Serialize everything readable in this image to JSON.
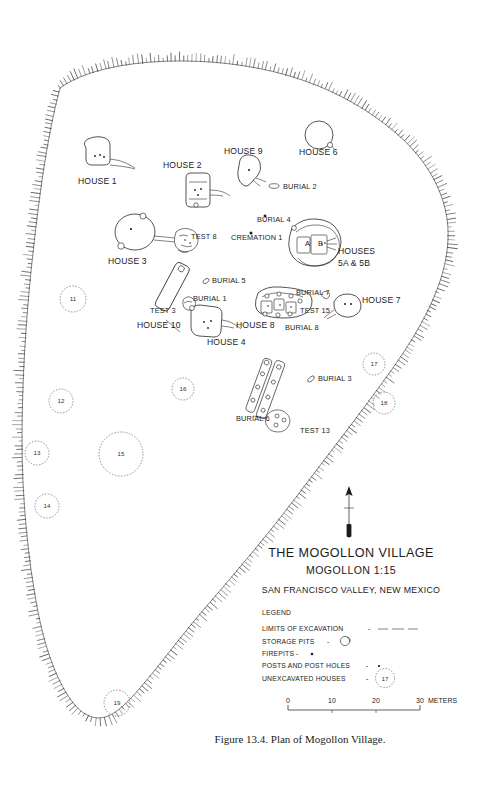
{
  "figure": {
    "caption": "Figure 13.4.  Plan of Mogollon Village.",
    "title": "THE MOGOLLON VILLAGE",
    "subtitle": "MOGOLLON   1:15",
    "location": "SAN FRANCISCO VALLEY, NEW MEXICO",
    "north_arrow": "north-arrow"
  },
  "legend": {
    "heading": "LEGEND",
    "items": [
      {
        "label": "LIMITS OF EXCAVATION",
        "separator": "-",
        "symbol": "dashed-line"
      },
      {
        "label": "STORAGE PITS",
        "separator": "-",
        "symbol": "storage-pit-oval"
      },
      {
        "label": "FIREPITS",
        "separator": "-",
        "symbol": "firepit-dot"
      },
      {
        "label": "POSTS AND POST HOLES",
        "separator": "-",
        "symbol": "post-hole-dot"
      },
      {
        "label": "UNEXCAVATED HOUSES",
        "separator": "-",
        "symbol": "dashed-circle",
        "symbol_text": "17"
      }
    ]
  },
  "scale": {
    "ticks": [
      "0",
      "10",
      "20",
      "30"
    ],
    "unit": "METERS"
  },
  "map_labels": [
    {
      "name": "house-1",
      "text": "HOUSE 1",
      "x": 78,
      "y": 184,
      "size": "big",
      "anchor": "start"
    },
    {
      "name": "house-2",
      "text": "HOUSE 2",
      "x": 163,
      "y": 168,
      "size": "big",
      "anchor": "start"
    },
    {
      "name": "house-9",
      "text": "HOUSE 9",
      "x": 224,
      "y": 154,
      "size": "big",
      "anchor": "start"
    },
    {
      "name": "house-6",
      "text": "HOUSE 6",
      "x": 299,
      "y": 155,
      "size": "big",
      "anchor": "start"
    },
    {
      "name": "burial-2",
      "text": "BURIAL 2",
      "x": 283,
      "y": 189,
      "size": "",
      "anchor": "start"
    },
    {
      "name": "burial-4",
      "text": "BURIAL 4",
      "x": 257,
      "y": 222,
      "size": "",
      "anchor": "start"
    },
    {
      "name": "cremation-1",
      "text": "CREMATION 1",
      "x": 231,
      "y": 240,
      "size": "",
      "anchor": "start"
    },
    {
      "name": "test-8",
      "text": "TEST 8",
      "x": 191,
      "y": 239,
      "size": "",
      "anchor": "start"
    },
    {
      "name": "house-3",
      "text": "HOUSE 3",
      "x": 108,
      "y": 264,
      "size": "big",
      "anchor": "start"
    },
    {
      "name": "houses-5a-5b-1",
      "text": "HOUSES",
      "x": 338,
      "y": 254,
      "size": "big",
      "anchor": "start"
    },
    {
      "name": "houses-5a-5b-2",
      "text": "5A & 5B",
      "x": 338,
      "y": 266,
      "size": "big",
      "anchor": "start"
    },
    {
      "name": "burial-5",
      "text": "BURIAL 5",
      "x": 212,
      "y": 283,
      "size": "",
      "anchor": "start"
    },
    {
      "name": "burial-1",
      "text": "BURIAL 1",
      "x": 193,
      "y": 301,
      "size": "",
      "anchor": "start"
    },
    {
      "name": "test-3",
      "text": "TEST 3",
      "x": 150,
      "y": 313,
      "size": "",
      "anchor": "start"
    },
    {
      "name": "house-10",
      "text": "HOUSE 10",
      "x": 137,
      "y": 328,
      "size": "big",
      "anchor": "start"
    },
    {
      "name": "house-4",
      "text": "HOUSE 4",
      "x": 207,
      "y": 345,
      "size": "big",
      "anchor": "start"
    },
    {
      "name": "house-8",
      "text": "HOUSE 8",
      "x": 236,
      "y": 328,
      "size": "big",
      "anchor": "start"
    },
    {
      "name": "burial-7",
      "text": "BURIAL 7",
      "x": 296,
      "y": 295,
      "size": "",
      "anchor": "start"
    },
    {
      "name": "test-15",
      "text": "TEST 15",
      "x": 300,
      "y": 313,
      "size": "",
      "anchor": "start"
    },
    {
      "name": "burial-8",
      "text": "BURIAL 8",
      "x": 285,
      "y": 330,
      "size": "",
      "anchor": "start"
    },
    {
      "name": "house-7",
      "text": "HOUSE 7",
      "x": 362,
      "y": 303,
      "size": "big",
      "anchor": "start"
    },
    {
      "name": "burial-3",
      "text": "BURIAL 3",
      "x": 318,
      "y": 381,
      "size": "",
      "anchor": "start"
    },
    {
      "name": "burial-6",
      "text": "BURIAL 6",
      "x": 236,
      "y": 421,
      "size": "",
      "anchor": "start"
    },
    {
      "name": "test-13",
      "text": "TEST 13",
      "x": 300,
      "y": 433,
      "size": "",
      "anchor": "start"
    },
    {
      "name": "house-5a-inner",
      "text": "A",
      "x": 305,
      "y": 246,
      "size": "",
      "anchor": "start"
    },
    {
      "name": "house-5b-inner",
      "text": "B",
      "x": 318,
      "y": 246,
      "size": "",
      "anchor": "start"
    }
  ],
  "unexcavated_houses": [
    {
      "name": "unexcavated-house-11",
      "number": "11",
      "cx": 73,
      "cy": 299,
      "r": 13
    },
    {
      "name": "unexcavated-house-12",
      "number": "12",
      "cx": 61,
      "cy": 401,
      "r": 12
    },
    {
      "name": "unexcavated-house-13",
      "number": "13",
      "cx": 37,
      "cy": 453,
      "r": 12
    },
    {
      "name": "unexcavated-house-14",
      "number": "14",
      "cx": 47,
      "cy": 506,
      "r": 12
    },
    {
      "name": "unexcavated-house-15",
      "number": "15",
      "cx": 121,
      "cy": 454,
      "r": 22
    },
    {
      "name": "unexcavated-house-16",
      "number": "16",
      "cx": 183,
      "cy": 389,
      "r": 11
    },
    {
      "name": "unexcavated-house-17",
      "number": "17",
      "cx": 374,
      "cy": 364,
      "r": 11
    },
    {
      "name": "unexcavated-house-18",
      "number": "18",
      "cx": 384,
      "cy": 403,
      "r": 11
    },
    {
      "name": "unexcavated-house-19",
      "number": "19",
      "cx": 117,
      "cy": 703,
      "r": 13
    }
  ]
}
